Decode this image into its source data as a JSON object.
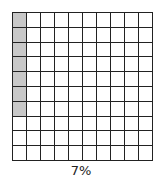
{
  "grid": {
    "rows": 10,
    "cols": 10,
    "shaded_count": 7,
    "shading_order": "column-major",
    "shade_color": "#c8c8c8",
    "empty_color": "#ffffff",
    "line_color": "#222222"
  },
  "label": "7%"
}
